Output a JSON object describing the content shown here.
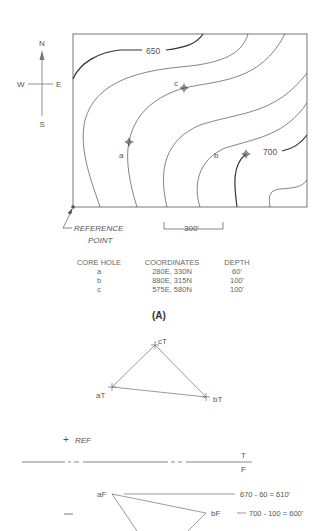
{
  "compass": {
    "north": "N",
    "south": "S",
    "east": "E",
    "west": "W"
  },
  "map": {
    "contour_labels": {
      "c650": "650",
      "c700": "700"
    },
    "core_hole_labels": {
      "a": "a",
      "b": "b",
      "c": "c"
    }
  },
  "reference_point": {
    "line1": "REFERENCE",
    "line2": "POINT"
  },
  "scale_bar": {
    "label": "300'"
  },
  "core_table": {
    "headers": [
      "CORE HOLE",
      "COORDINATES",
      "DEPTH"
    ],
    "rows": [
      [
        "a",
        "280E, 330N",
        "60'"
      ],
      [
        "b",
        "880E, 315N",
        "100'"
      ],
      [
        "c",
        "575E, 580N",
        "100'"
      ]
    ]
  },
  "caption": "(A)",
  "top_view": {
    "cT": "cT",
    "aT": "aT",
    "bT": "bT"
  },
  "fold_view": {
    "ref": "REF",
    "T": "T",
    "F": "F",
    "aF": "aF",
    "bF": "bF",
    "plus": "+",
    "minus": "—",
    "eq_a": "670 - 60 = 610'",
    "eq_b": "700 - 100 = 600'"
  }
}
